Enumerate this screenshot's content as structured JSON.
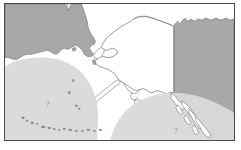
{
  "map": {
    "title": "Alaska region map",
    "regions": [
      {
        "id": "siberia-landmass",
        "label": "Siberia / Chukotka landmass",
        "fill": "#a8a8a8"
      },
      {
        "id": "canada-landmass",
        "label": "Canada landmass",
        "fill": "#a8a8a8"
      },
      {
        "id": "alaska-landmass",
        "label": "Alaska",
        "fill": "#ffffff"
      },
      {
        "id": "bering-sea-zone",
        "label": "Bering Sea shaded zone",
        "fill": "#d9d9d9"
      },
      {
        "id": "gulf-of-alaska-zone",
        "label": "Gulf of Alaska shaded zone",
        "fill": "#d9d9d9"
      }
    ],
    "markers": [
      {
        "id": "west-marker",
        "text": "?",
        "area": "Bering Sea"
      },
      {
        "id": "east-marker",
        "text": "?",
        "area": "Gulf of Alaska"
      }
    ],
    "colors": {
      "frame": "#4a4a50",
      "land_gray": "#a8a8a8",
      "zone_gray": "#d9d9d9",
      "water": "#ffffff",
      "coastline": "#6f6f6f",
      "border_line": "#6f6f6f",
      "marker": "#8d8d8d"
    },
    "background": "#ffffff"
  }
}
